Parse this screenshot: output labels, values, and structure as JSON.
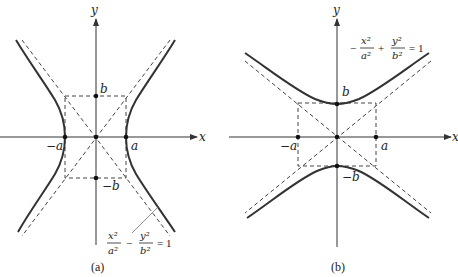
{
  "figure": {
    "panels": [
      {
        "id": "a",
        "caption": "(a)",
        "axes": {
          "x_label": "x",
          "y_label": "y"
        },
        "vertices": [
          {
            "label": "-a",
            "display": "−a"
          },
          {
            "label": "a",
            "display": "a"
          }
        ],
        "covertices": [
          {
            "label": "b",
            "display": "b"
          },
          {
            "label": "-b",
            "display": "−b"
          }
        ],
        "equation": {
          "term1_num": "x²",
          "term1_den": "a²",
          "operator": "−",
          "term2_num": "y²",
          "term2_den": "b²",
          "rhs": "= 1"
        },
        "description": "Hyperbola opening left-right with asymptotes through the corners of the dashed rectangle"
      },
      {
        "id": "b",
        "caption": "(b)",
        "axes": {
          "x_label": "x",
          "y_label": "y"
        },
        "vertices": [
          {
            "label": "b",
            "display": "b"
          },
          {
            "label": "-b",
            "display": "−b"
          }
        ],
        "covertices": [
          {
            "label": "-a",
            "display": "−a"
          },
          {
            "label": "a",
            "display": "a"
          }
        ],
        "equation": {
          "sign": "−",
          "term1_num": "x²",
          "term1_den": "a²",
          "operator": "+",
          "term2_num": "y²",
          "term2_den": "b²",
          "rhs": "= 1"
        },
        "description": "Hyperbola opening up-down with asymptotes through the corners of the dashed rectangle"
      }
    ]
  }
}
